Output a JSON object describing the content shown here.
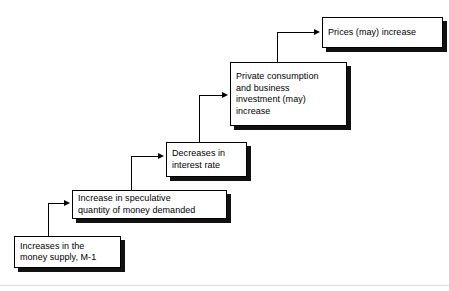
{
  "diagram": {
    "top_caption": "",
    "nodes": [
      {
        "id": "prices",
        "label": "Prices (may) increase"
      },
      {
        "id": "consumption",
        "label": "Private consumption\nand business\ninvestment (may)\nincrease"
      },
      {
        "id": "interest",
        "label": "Decreases in\ninterest rate"
      },
      {
        "id": "speculative",
        "label": "Increase in speculative\nquantity of money demanded"
      },
      {
        "id": "money",
        "label": "Increases in the\nmoney supply, M-1"
      }
    ],
    "edges": [
      {
        "from": "money",
        "to": "speculative"
      },
      {
        "from": "speculative",
        "to": "interest"
      },
      {
        "from": "interest",
        "to": "consumption"
      },
      {
        "from": "consumption",
        "to": "prices"
      }
    ],
    "colors": {
      "box_fill": "#ffffff",
      "box_border": "#000000",
      "box_shadow": "#111111",
      "connector": "#000000",
      "rule": "#dcdcdc"
    }
  }
}
